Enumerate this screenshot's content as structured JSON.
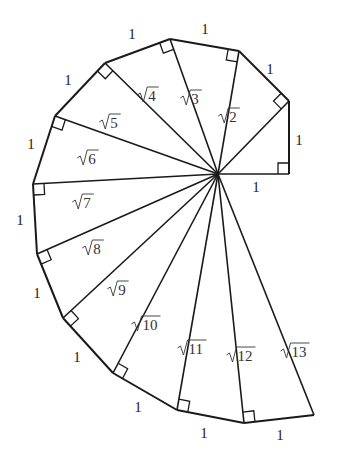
{
  "center": [
    218,
    174
  ],
  "vertices": [
    [
      289,
      174
    ],
    [
      289,
      101
    ],
    [
      239,
      51
    ],
    [
      170,
      39
    ],
    [
      105,
      63
    ],
    [
      55,
      116
    ],
    [
      33,
      184
    ],
    [
      37,
      254
    ],
    [
      63,
      318
    ],
    [
      113,
      373
    ],
    [
      177,
      410
    ],
    [
      244,
      423
    ],
    [
      314,
      415
    ]
  ],
  "unit_labels": [
    {
      "text": "1",
      "x": 256,
      "y": 192
    },
    {
      "text": "1",
      "x": 299,
      "y": 145
    },
    {
      "text": "1",
      "x": 270,
      "y": 74
    },
    {
      "text": "1",
      "x": 205,
      "y": 34
    },
    {
      "text": "1",
      "x": 132,
      "y": 39
    },
    {
      "text": "1",
      "x": 68,
      "y": 85
    },
    {
      "text": "1",
      "x": 31,
      "y": 149
    },
    {
      "text": "1",
      "x": 20,
      "y": 225
    },
    {
      "text": "1",
      "x": 37,
      "y": 298
    },
    {
      "text": "1",
      "x": 77,
      "y": 362
    },
    {
      "text": "1",
      "x": 138,
      "y": 412
    },
    {
      "text": "1",
      "x": 204,
      "y": 438
    },
    {
      "text": "1",
      "x": 280,
      "y": 440
    }
  ],
  "hypotenuse_labels": [
    {
      "text": "2",
      "x": 233,
      "y": 122
    },
    {
      "text": "3",
      "x": 195,
      "y": 104
    },
    {
      "text": "4",
      "x": 152,
      "y": 101
    },
    {
      "text": "5",
      "x": 114,
      "y": 128
    },
    {
      "text": "6",
      "x": 92,
      "y": 164
    },
    {
      "text": "7",
      "x": 87,
      "y": 208
    },
    {
      "text": "8",
      "x": 97,
      "y": 254
    },
    {
      "text": "9",
      "x": 122,
      "y": 295
    },
    {
      "text": "10",
      "x": 150,
      "y": 330
    },
    {
      "text": "11",
      "x": 196,
      "y": 354
    },
    {
      "text": "12",
      "x": 245,
      "y": 361
    },
    {
      "text": "13",
      "x": 299,
      "y": 357
    }
  ],
  "colors": {
    "line": "#1a1a1a",
    "text": "#222222",
    "background": "#ffffff"
  }
}
